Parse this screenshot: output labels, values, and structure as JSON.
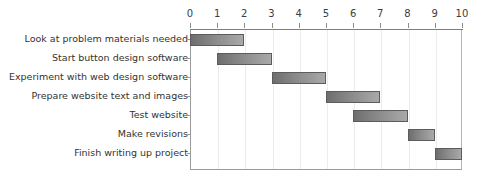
{
  "chart_data": {
    "type": "bar",
    "chart_subtype": "gantt",
    "title": "",
    "xlabel": "",
    "ylabel": "",
    "xlim": [
      0,
      10
    ],
    "x_axis_position": "top",
    "grid": true,
    "legend": false,
    "x_ticks": [
      0,
      1,
      2,
      3,
      4,
      5,
      6,
      7,
      8,
      9,
      10
    ],
    "x_tick_labels": [
      "0",
      "1",
      "2",
      "3",
      "4",
      "5",
      "6",
      "7",
      "8",
      "9",
      "10"
    ],
    "categories": [
      "Look at problem materials needed",
      "Start button design software",
      "Experiment with web design software",
      "Prepare website text and images",
      "Test website",
      "Make revisions",
      "Finish writing up project"
    ],
    "tasks": [
      {
        "label": "Look at problem materials needed",
        "start": 0,
        "end": 2,
        "duration": 2
      },
      {
        "label": "Start button design software",
        "start": 1,
        "end": 3,
        "duration": 2
      },
      {
        "label": "Experiment with web design software",
        "start": 3,
        "end": 5,
        "duration": 2
      },
      {
        "label": "Prepare website text and images",
        "start": 5,
        "end": 7,
        "duration": 2
      },
      {
        "label": "Test website",
        "start": 6,
        "end": 8,
        "duration": 2
      },
      {
        "label": "Make revisions",
        "start": 8,
        "end": 9,
        "duration": 1
      },
      {
        "label": "Finish writing up project",
        "start": 9,
        "end": 10,
        "duration": 1
      }
    ],
    "bar_fill_start_color": "#6e6e6e",
    "bar_fill_end_color": "#a9a9a9",
    "bar_border_color": "#5c5c5c",
    "gridline_color": "#ececec",
    "axis_color": "#8c8c8c",
    "text_color": "#333333",
    "background_color": "#ffffff"
  }
}
